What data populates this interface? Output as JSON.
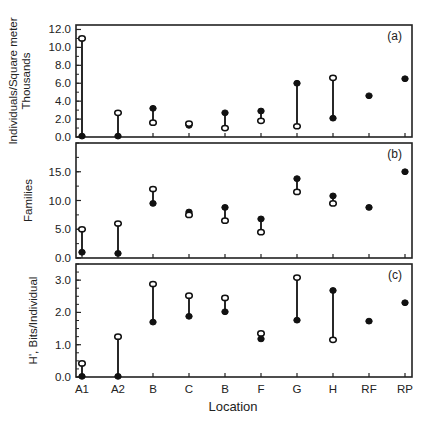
{
  "figure": {
    "xlabel": "Location",
    "categories": [
      "A1",
      "A2",
      "B",
      "C",
      "B",
      "F",
      "G",
      "H",
      "RF",
      "RP"
    ]
  },
  "chart_data": [
    {
      "type": "scatter",
      "panel_label": "(a)",
      "ylabel_line1": "Individuals/Square meter",
      "ylabel_line2": "Thousands",
      "xlabel": "Location",
      "categories": [
        "A1",
        "A2",
        "B",
        "C",
        "B",
        "F",
        "G",
        "H",
        "RF",
        "RP"
      ],
      "ylim": [
        0,
        12.5
      ],
      "yticks": [
        0,
        2,
        4,
        6,
        8,
        10,
        12
      ],
      "ytick_labels": [
        "0.0",
        "2.0",
        "4.0",
        "6.0",
        "8.0",
        "10.0",
        "12.0"
      ],
      "series": [
        {
          "name": "open",
          "marker": "open-circle",
          "values": [
            11.0,
            2.7,
            1.6,
            1.5,
            1.0,
            1.8,
            1.2,
            6.6,
            null,
            null
          ]
        },
        {
          "name": "filled",
          "marker": "filled-circle",
          "values": [
            0.1,
            0.1,
            3.2,
            1.3,
            2.7,
            2.9,
            6.0,
            2.1,
            4.6,
            6.5
          ]
        }
      ],
      "grid": false
    },
    {
      "type": "scatter",
      "panel_label": "(b)",
      "ylabel_line1": "Families",
      "xlabel": "Location",
      "categories": [
        "A1",
        "A2",
        "B",
        "C",
        "B",
        "F",
        "G",
        "H",
        "RF",
        "RP"
      ],
      "ylim": [
        0,
        20
      ],
      "yticks": [
        0,
        5,
        10,
        15
      ],
      "ytick_labels": [
        "0.0",
        "5.0",
        "10.0",
        "15.0"
      ],
      "series": [
        {
          "name": "open",
          "marker": "open-circle",
          "values": [
            5.0,
            6.0,
            12.0,
            7.5,
            6.5,
            4.5,
            11.5,
            9.5,
            null,
            null
          ]
        },
        {
          "name": "filled",
          "marker": "filled-circle",
          "values": [
            1.0,
            0.8,
            9.5,
            8.0,
            8.8,
            6.8,
            13.8,
            10.8,
            8.8,
            15.0
          ]
        }
      ],
      "grid": false
    },
    {
      "type": "scatter",
      "panel_label": "(c)",
      "ylabel_line1": "H', Bits/Individual",
      "xlabel": "Location",
      "categories": [
        "A1",
        "A2",
        "B",
        "C",
        "B",
        "F",
        "G",
        "H",
        "RF",
        "RP"
      ],
      "ylim": [
        0,
        3.5
      ],
      "yticks": [
        0,
        1,
        2,
        3
      ],
      "ytick_labels": [
        "0.0",
        "1.0",
        "2.0",
        "3.0"
      ],
      "series": [
        {
          "name": "open",
          "marker": "open-circle",
          "values": [
            0.42,
            1.25,
            2.88,
            2.52,
            2.45,
            1.35,
            3.08,
            1.15,
            null,
            null
          ]
        },
        {
          "name": "filled",
          "marker": "filled-circle",
          "values": [
            0.02,
            0.02,
            1.7,
            1.88,
            2.02,
            1.18,
            1.76,
            2.68,
            1.73,
            2.3
          ]
        }
      ],
      "grid": false
    }
  ]
}
